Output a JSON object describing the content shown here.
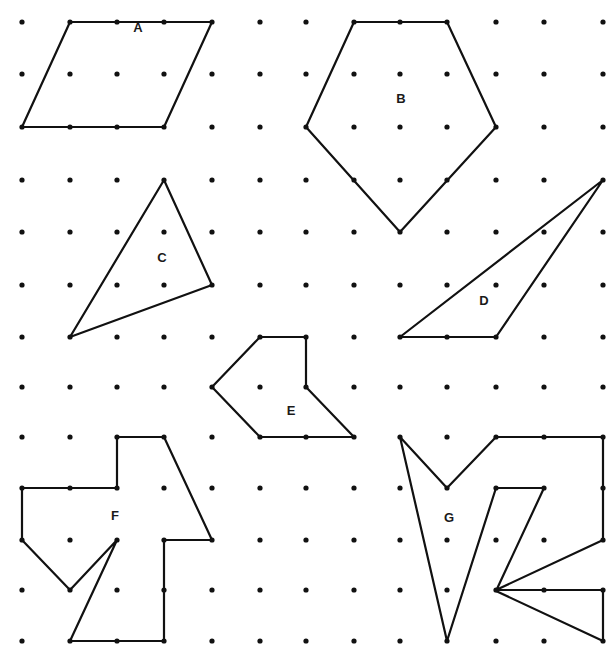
{
  "diagram": {
    "type": "dot-grid-polygons",
    "grid": {
      "cols_x": [
        22,
        70,
        117,
        164,
        212,
        260,
        306,
        354,
        400,
        447,
        496,
        544,
        603
      ],
      "rows_y": [
        22,
        74,
        127,
        180,
        232,
        285,
        337,
        387,
        437,
        488,
        540,
        590,
        641
      ],
      "dot_color": "#111111",
      "dot_radius": 2.6
    },
    "line_color": "#111111",
    "line_width": 2.2,
    "shapes": [
      {
        "id": "A",
        "label": "A",
        "label_pos": [
          138,
          32
        ],
        "vertices": [
          [
            1,
            0
          ],
          [
            4,
            0
          ],
          [
            3,
            2
          ],
          [
            0,
            2
          ]
        ]
      },
      {
        "id": "B",
        "label": "B",
        "label_pos": [
          401,
          103
        ],
        "vertices": [
          [
            7,
            0
          ],
          [
            9,
            0
          ],
          [
            10,
            2
          ],
          [
            8,
            4
          ],
          [
            6,
            2
          ]
        ]
      },
      {
        "id": "C",
        "label": "C",
        "label_pos": [
          162,
          262
        ],
        "vertices": [
          [
            3,
            3
          ],
          [
            4,
            5
          ],
          [
            1,
            6
          ]
        ]
      },
      {
        "id": "D",
        "label": "D",
        "label_pos": [
          484,
          305
        ],
        "vertices": [
          [
            12,
            3
          ],
          [
            10,
            6
          ],
          [
            8,
            6
          ]
        ]
      },
      {
        "id": "E",
        "label": "E",
        "label_pos": [
          291,
          415
        ],
        "vertices": [
          [
            5,
            6
          ],
          [
            6,
            6
          ],
          [
            6,
            7
          ],
          [
            7,
            8
          ],
          [
            5,
            8
          ],
          [
            4,
            7
          ]
        ]
      },
      {
        "id": "F",
        "label": "F",
        "label_pos": [
          115,
          520
        ],
        "vertices": [
          [
            2,
            8
          ],
          [
            3,
            8
          ],
          [
            4,
            10
          ],
          [
            3,
            10
          ],
          [
            3,
            12
          ],
          [
            1,
            12
          ],
          [
            2,
            10
          ],
          [
            1,
            11
          ],
          [
            0,
            10
          ],
          [
            0,
            9
          ],
          [
            2,
            9
          ]
        ]
      },
      {
        "id": "G",
        "label": "G",
        "label_pos": [
          449,
          522
        ],
        "vertices": [
          [
            8,
            8
          ],
          [
            9,
            9
          ],
          [
            10,
            8
          ],
          [
            12,
            8
          ],
          [
            12,
            10
          ],
          [
            10,
            11
          ],
          [
            12,
            11
          ],
          [
            12,
            12
          ],
          [
            10,
            11.02
          ],
          [
            11,
            9
          ],
          [
            10,
            9
          ],
          [
            9,
            12
          ]
        ]
      }
    ]
  }
}
